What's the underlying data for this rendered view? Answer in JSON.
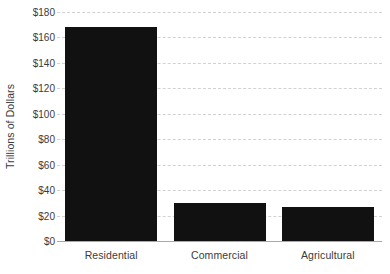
{
  "chart_data": {
    "type": "bar",
    "title": "",
    "xlabel": "",
    "ylabel": "Trillions of Dollars",
    "categories": [
      "Residential",
      "Commercial",
      "Agricultural"
    ],
    "values": [
      168,
      30,
      27
    ],
    "series": [
      {
        "name": "Value of Land",
        "values": [
          168,
          30,
          27
        ]
      }
    ],
    "ylim": [
      0,
      180
    ],
    "ytick_values": [
      0,
      20,
      40,
      60,
      80,
      100,
      120,
      140,
      160,
      180
    ],
    "ytick_labels": [
      "$0",
      "$20",
      "$40",
      "$60",
      "$80",
      "$100",
      "$120",
      "$140",
      "$160",
      "$180"
    ],
    "grid": true,
    "grid_axis": "y",
    "grid_style": "dashed",
    "legend": false,
    "legend_position": "none",
    "bar_color": "#111111",
    "grid_color": "#d2d2d2",
    "axis_color": "#a8a8a8",
    "text_color": "#3b3b3b"
  }
}
